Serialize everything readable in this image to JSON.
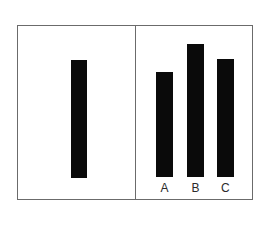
{
  "figure": {
    "frame_border_color": "#6b6b6b",
    "background_color": "#ffffff",
    "bar_color": "#0a0a0a",
    "label_color": "#2b2b2b"
  },
  "chart_data": [
    {
      "type": "bar",
      "panel": "left",
      "title": "",
      "xlabel": "",
      "ylabel": "",
      "grid": false,
      "legend": false,
      "categories": [
        ""
      ],
      "values": [
        118
      ],
      "ylim": [
        0,
        140
      ],
      "bar_geometry": [
        {
          "label": "",
          "x": 53,
          "width": 16,
          "height": 118
        }
      ]
    },
    {
      "type": "bar",
      "panel": "right",
      "title": "",
      "xlabel": "",
      "ylabel": "",
      "grid": false,
      "legend": false,
      "categories": [
        "A",
        "B",
        "C"
      ],
      "values": [
        105,
        133,
        118
      ],
      "ylim": [
        0,
        140
      ],
      "bar_geometry": [
        {
          "label": "A",
          "x": 20,
          "width": 17,
          "height": 105
        },
        {
          "label": "B",
          "x": 51,
          "width": 17,
          "height": 133
        },
        {
          "label": "C",
          "x": 81,
          "width": 17,
          "height": 118
        }
      ]
    }
  ]
}
